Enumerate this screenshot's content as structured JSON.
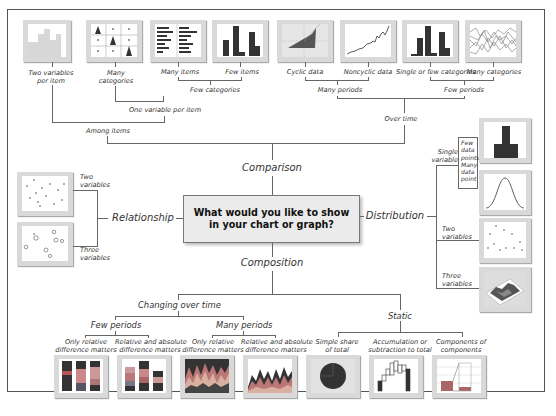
{
  "center": {
    "line1": "What would you like to show",
    "line2": "in your chart or graph?"
  },
  "branches": {
    "comparison": "Comparison",
    "relationship": "Relationship",
    "distribution": "Distribution",
    "composition": "Composition"
  },
  "comparison": {
    "among_items": "Among items",
    "over_time": "Over time",
    "two_variables_per_item": [
      "Two variables",
      "per item"
    ],
    "one_variable_per_item": "One variable per item",
    "many_categories": [
      "Many",
      "categories"
    ],
    "few_categories": "Few categories",
    "many_items": "Many items",
    "few_items": "Few items",
    "many_periods": "Many periods",
    "few_periods": "Few periods",
    "cyclic_data": "Cyclic data",
    "noncyclic_data": "Noncyclic data",
    "single_or_few_categories": "Single or few categories",
    "many_categories_time": "Many categories"
  },
  "relationship": {
    "two_variables": [
      "Two",
      "variables"
    ],
    "three_variables": [
      "Three",
      "variables"
    ]
  },
  "distribution": {
    "single_variable": [
      "Single",
      "variable"
    ],
    "few_data_points": [
      "Few",
      "data",
      "points"
    ],
    "many_data_points": [
      "Many",
      "data",
      "point"
    ],
    "two_variables": [
      "Two",
      "variables"
    ],
    "three_variables": [
      "Three",
      "variables"
    ]
  },
  "composition": {
    "changing_over_time": "Changing over time",
    "static": "Static",
    "few_periods": "Few periods",
    "many_periods": "Many periods",
    "only_relative_1": [
      "Only relative",
      "difference matters"
    ],
    "rel_abs_1": [
      "Relative and absolute",
      "difference matters"
    ],
    "only_relative_2": [
      "Only relative",
      "difference matters"
    ],
    "rel_abs_2": [
      "Relative and absolute",
      "difference matters"
    ],
    "simple_share": [
      "Simple share",
      "of total"
    ],
    "accumulation": [
      "Accumulation or",
      "subtraction to total"
    ],
    "components": [
      "Components of",
      "components"
    ]
  },
  "colors": {
    "thumb_frame": "#d9d9d9",
    "dark": "#3a3a3a",
    "line": "#666666",
    "center_bg": "#ebebeb"
  }
}
